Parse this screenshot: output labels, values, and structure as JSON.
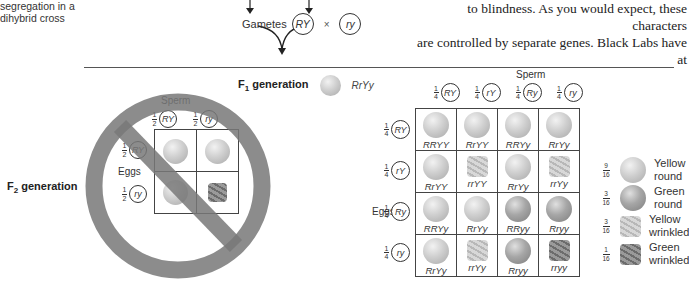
{
  "caption": {
    "line1": "segregation in a",
    "line2": "dihybrid cross"
  },
  "body_text": {
    "line1": "to blindness. As you would expect, these characters",
    "line2": "are controlled by separate genes. Black Labs have at"
  },
  "gametes": {
    "label": "Gametes",
    "left": "RY",
    "cross": "×",
    "right": "ry"
  },
  "f1": {
    "label": "F",
    "sub": "1",
    "rest": " generation",
    "genotype": "RrYy"
  },
  "f2": {
    "label": "F",
    "sub": "2",
    "rest": " generation"
  },
  "small_square": {
    "status": "crossed-out (incorrect hypothesis)",
    "sperm_label": "Sperm",
    "eggs_label": "Eggs",
    "columns": [
      {
        "frac_num": "1",
        "frac_den": "2",
        "allele": "RY"
      },
      {
        "frac_num": "1",
        "frac_den": "2",
        "allele": "ry"
      }
    ],
    "rows": [
      {
        "frac_num": "1",
        "frac_den": "2",
        "allele": "RY"
      },
      {
        "frac_num": "1",
        "frac_den": "2",
        "allele": "ry"
      }
    ],
    "cells": [
      [
        "yellow-round",
        "yellow-round"
      ],
      [
        "yellow-round",
        "green-wrinkled"
      ]
    ]
  },
  "large_square": {
    "sperm_label": "Sperm",
    "eggs_label": "Eggs",
    "columns": [
      {
        "frac_num": "1",
        "frac_den": "4",
        "allele": "RY"
      },
      {
        "frac_num": "1",
        "frac_den": "4",
        "allele": "rY"
      },
      {
        "frac_num": "1",
        "frac_den": "4",
        "allele": "Ry"
      },
      {
        "frac_num": "1",
        "frac_den": "4",
        "allele": "ry"
      }
    ],
    "rows": [
      {
        "frac_num": "1",
        "frac_den": "4",
        "allele": "RY",
        "cells": [
          {
            "g": "RRYY",
            "p": "yr"
          },
          {
            "g": "RrYY",
            "p": "yr"
          },
          {
            "g": "RRYy",
            "p": "yr"
          },
          {
            "g": "RrYy",
            "p": "yr"
          }
        ]
      },
      {
        "frac_num": "1",
        "frac_den": "4",
        "allele": "rY",
        "cells": [
          {
            "g": "RrYY",
            "p": "yr"
          },
          {
            "g": "rrYY",
            "p": "yw"
          },
          {
            "g": "RrYy",
            "p": "yr"
          },
          {
            "g": "rrYy",
            "p": "yw"
          }
        ]
      },
      {
        "frac_num": "1",
        "frac_den": "4",
        "allele": "Ry",
        "cells": [
          {
            "g": "RRYy",
            "p": "yr"
          },
          {
            "g": "RrYy",
            "p": "yr"
          },
          {
            "g": "RRyy",
            "p": "gr"
          },
          {
            "g": "Rryy",
            "p": "gr"
          }
        ]
      },
      {
        "frac_num": "1",
        "frac_den": "4",
        "allele": "ry",
        "cells": [
          {
            "g": "RrYy",
            "p": "yr"
          },
          {
            "g": "rrYy",
            "p": "yw"
          },
          {
            "g": "Rryy",
            "p": "gr"
          },
          {
            "g": "rryy",
            "p": "gw"
          }
        ]
      }
    ]
  },
  "legend": [
    {
      "num": "9",
      "den": "16",
      "line1": "Yellow",
      "line2": "round",
      "p": "yr"
    },
    {
      "num": "3",
      "den": "16",
      "line1": "Green",
      "line2": "round",
      "p": "gr"
    },
    {
      "num": "3",
      "den": "16",
      "line1": "Yellow",
      "line2": "wrinkled",
      "p": "yw"
    },
    {
      "num": "1",
      "den": "16",
      "line1": "Green",
      "line2": "wrinkled",
      "p": "gw"
    }
  ]
}
